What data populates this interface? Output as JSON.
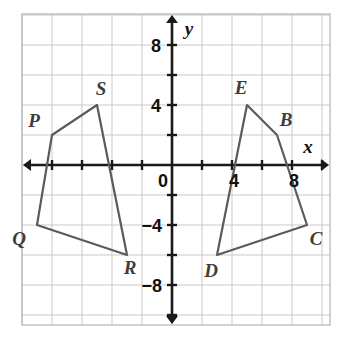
{
  "figure": {
    "axis_labels": {
      "x": "x",
      "y": "y"
    },
    "origin_label": "0"
  },
  "axes": {
    "x_tick_labels": [
      {
        "value": 4,
        "text": "4"
      },
      {
        "value": 8,
        "text": "8"
      }
    ],
    "y_tick_labels": [
      {
        "value": 8,
        "text": "8"
      },
      {
        "value": 4,
        "text": "4"
      },
      {
        "value": -4,
        "text": "−4"
      },
      {
        "value": -8,
        "text": "−8"
      }
    ],
    "x_range": [
      -10,
      10
    ],
    "y_range": [
      -10,
      10
    ],
    "tick_interval": 2,
    "grid_interval": 2,
    "grid_visible": true
  },
  "chart_data": {
    "type": "scatter",
    "xlabel": "x",
    "ylabel": "y",
    "xlim": [
      -10,
      10
    ],
    "ylim": [
      -10,
      10
    ],
    "grid": true,
    "tick_interval": 2,
    "shapes": [
      {
        "name": "quadrilateral-PQRS",
        "closed": true,
        "vertices": [
          {
            "label": "P",
            "x": -8,
            "y": 2,
            "label_dx": -18,
            "label_dy": -8
          },
          {
            "label": "S",
            "x": -5,
            "y": 4,
            "label_dx": 4,
            "label_dy": -10
          },
          {
            "label": "R",
            "x": -3,
            "y": -6,
            "label_dx": 3,
            "label_dy": 19
          },
          {
            "label": "Q",
            "x": -9,
            "y": -4,
            "label_dx": -18,
            "label_dy": 20
          }
        ]
      },
      {
        "name": "quadrilateral-BCDE",
        "closed": true,
        "vertices": [
          {
            "label": "E",
            "x": 5,
            "y": 4,
            "label_dx": -6,
            "label_dy": -11
          },
          {
            "label": "B",
            "x": 7,
            "y": 2,
            "label_dx": 9,
            "label_dy": -9
          },
          {
            "label": "C",
            "x": 9,
            "y": -4,
            "label_dx": 9,
            "label_dy": 20
          },
          {
            "label": "D",
            "x": 3,
            "y": -6,
            "label_dx": -6,
            "label_dy": 22
          }
        ]
      }
    ]
  },
  "colors": {
    "grid": "#c9c9c9",
    "axis": "#1a1a1a",
    "shape_stroke": "#5b5b5b",
    "label_text": "#3d3d3d",
    "background": "#ffffff"
  }
}
